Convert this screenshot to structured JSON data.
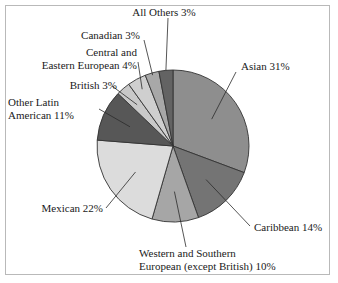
{
  "figure": {
    "background_color": "#ffffff",
    "frame_color": "#b9b9b9",
    "outline_color": "#333333"
  },
  "chart_data": {
    "type": "pie",
    "title": "",
    "subtitle": "",
    "xlabel": "",
    "ylabel": "",
    "legend_position": "none-callout-labels",
    "grid": false,
    "units": "percent",
    "start_angle_deg": 0,
    "direction": "clockwise",
    "categories": [
      "Asian",
      "Caribbean",
      "Western and Southern European (except British)",
      "Mexican",
      "Other Latin American",
      "British",
      "Central and Eastern European",
      "Canadian",
      "All Others"
    ],
    "values": [
      31,
      14,
      10,
      22,
      11,
      3,
      4,
      3,
      3
    ],
    "slices": [
      {
        "name": "Asian",
        "value": 31,
        "label": "Asian 31%",
        "color": "#8e8e8e"
      },
      {
        "name": "Caribbean",
        "value": 14,
        "label": "Caribbean 14%",
        "color": "#747474"
      },
      {
        "name": "Western and Southern European (except British)",
        "value": 10,
        "label_line1": "Western and Southern",
        "label_line2": "European (except British) 10%",
        "color": "#a6a6a6"
      },
      {
        "name": "Mexican",
        "value": 22,
        "label": "Mexican 22%",
        "color": "#dcdcdc"
      },
      {
        "name": "Other Latin American",
        "value": 11,
        "label_line1": "Other Latin",
        "label_line2": "American 11%",
        "color": "#575757"
      },
      {
        "name": "British",
        "value": 3,
        "label": "British 3%",
        "color": "#c9c9c9"
      },
      {
        "name": "Central and Eastern European",
        "value": 4,
        "label_line1": "Central and",
        "label_line2": "Eastern European 4%",
        "color": "#cfcfcf"
      },
      {
        "name": "Canadian",
        "value": 3,
        "label": "Canadian 3%",
        "color": "#a8a8a8"
      },
      {
        "name": "All Others",
        "value": 3,
        "label": "All Others 3%",
        "color": "#636363"
      }
    ]
  }
}
